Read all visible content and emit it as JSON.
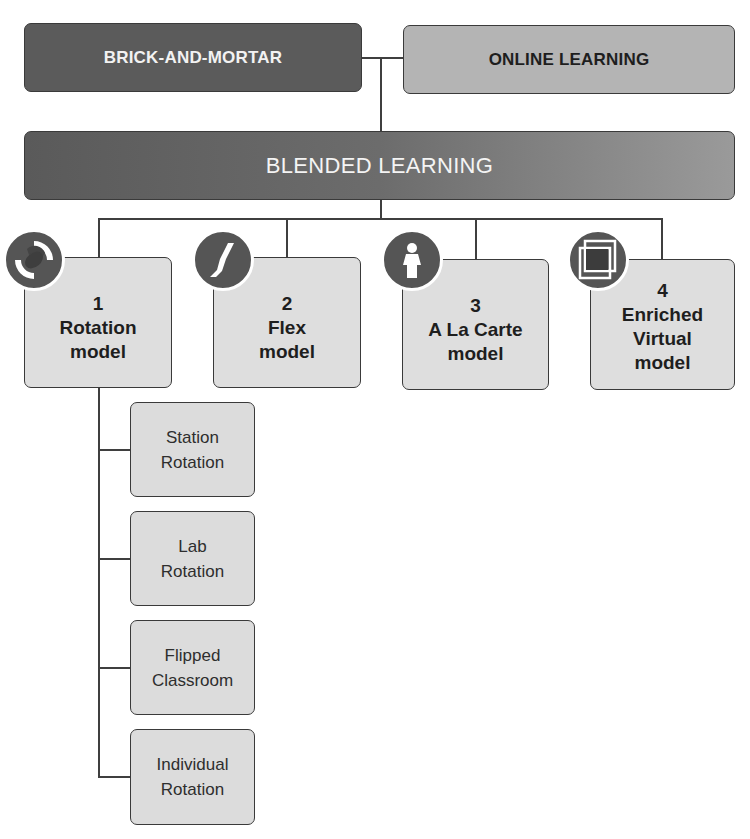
{
  "diagram": {
    "top": {
      "left_label": "BRICK-AND-MORTAR",
      "right_label": "ONLINE LEARNING"
    },
    "center_label": "BLENDED LEARNING",
    "models": [
      {
        "number": "1",
        "lines": [
          "Rotation",
          "model"
        ],
        "icon": "rotation-arrows-icon"
      },
      {
        "number": "2",
        "lines": [
          "Flex",
          "model"
        ],
        "icon": "flex-path-icon"
      },
      {
        "number": "3",
        "lines": [
          "A La Carte",
          "model"
        ],
        "icon": "person-icon"
      },
      {
        "number": "4",
        "lines": [
          "Enriched",
          "Virtual",
          "model"
        ],
        "icon": "overlapping-squares-icon"
      }
    ],
    "rotation_submodels": [
      {
        "lines": [
          "Station",
          "Rotation"
        ]
      },
      {
        "lines": [
          "Lab",
          "Rotation"
        ]
      },
      {
        "lines": [
          "Flipped",
          "Classroom"
        ]
      },
      {
        "lines": [
          "Individual",
          "Rotation"
        ]
      }
    ]
  },
  "colors": {
    "dark_box": "#5b5b5b",
    "light_box": "#b4b4b4",
    "model_box": "#dedede",
    "icon_fill": "#555555",
    "line": "#3f3f3f"
  }
}
